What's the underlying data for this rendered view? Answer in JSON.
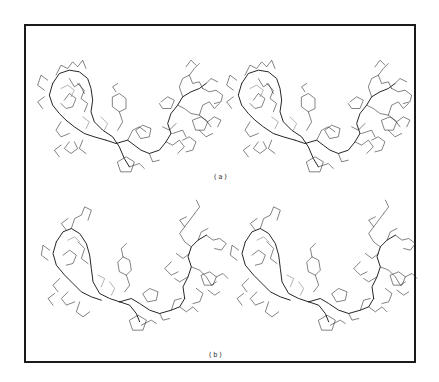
{
  "figure": {
    "type": "stereo-pair molecular wireframe diagrams",
    "panels": [
      {
        "id": "a",
        "label": "(a)",
        "views": [
          "left-eye",
          "right-eye"
        ]
      },
      {
        "id": "b",
        "label": "(b)",
        "views": [
          "left-eye",
          "right-eye"
        ]
      }
    ],
    "border_color": "#1a1a1a",
    "line_color": "#2a2a2a",
    "background": "#ffffff"
  }
}
